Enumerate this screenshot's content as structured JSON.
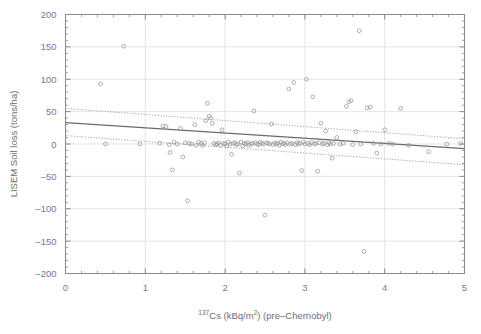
{
  "figure": {
    "background": "#ffffff",
    "axes_color": "#8a8a8a",
    "grid_color": "#d9d9d9",
    "marker_color": "#9a9a9a",
    "fit_color": "#6a6a6a",
    "ci_color": "#9a9a9a"
  },
  "labels": {
    "xaxis_prefix": "137",
    "xaxis_element": "Cs",
    "xaxis_units_open": " (kBq/m",
    "xaxis_units_exp": "2",
    "xaxis_units_close": ") (pre–Chernobyl)",
    "yaxis": "LISEM Soil loss (tons/ha)"
  },
  "chart_data": {
    "type": "scatter",
    "title": "",
    "xlabel": "137Cs (kBq/m2) (pre-Chernobyl)",
    "ylabel": "LISEM Soil loss (tons/ha)",
    "xlim": [
      0,
      5
    ],
    "ylim": [
      -200,
      200
    ],
    "xticks": [
      0,
      1,
      2,
      3,
      4,
      5
    ],
    "yticks": [
      -200,
      -150,
      -100,
      -50,
      0,
      50,
      100,
      150,
      200
    ],
    "xticklabels": [
      "0",
      "1",
      "2",
      "3",
      "4",
      "5"
    ],
    "yticklabels": [
      "-200",
      "-150",
      "-100",
      "-50",
      "0",
      "50",
      "100",
      "150",
      "200"
    ],
    "minor_ticks": true,
    "grid": true,
    "legend": null,
    "marker": "open-circle",
    "series": [
      {
        "name": "samples",
        "points": [
          [
            0.44,
            93
          ],
          [
            0.5,
            0
          ],
          [
            0.73,
            151
          ],
          [
            0.93,
            0
          ],
          [
            1.18,
            1
          ],
          [
            1.22,
            28
          ],
          [
            1.26,
            27
          ],
          [
            1.3,
            -1
          ],
          [
            1.31,
            -13
          ],
          [
            1.34,
            -40
          ],
          [
            1.36,
            3
          ],
          [
            1.4,
            0
          ],
          [
            1.44,
            24
          ],
          [
            1.47,
            -20
          ],
          [
            1.5,
            2
          ],
          [
            1.53,
            -88
          ],
          [
            1.55,
            1
          ],
          [
            1.58,
            0
          ],
          [
            1.62,
            30
          ],
          [
            1.64,
            -2
          ],
          [
            1.67,
            3
          ],
          [
            1.7,
            1
          ],
          [
            1.72,
            -2
          ],
          [
            1.74,
            2
          ],
          [
            1.76,
            36
          ],
          [
            1.78,
            63
          ],
          [
            1.8,
            43
          ],
          [
            1.82,
            40
          ],
          [
            1.84,
            32
          ],
          [
            1.86,
            1
          ],
          [
            1.88,
            -1
          ],
          [
            1.9,
            0
          ],
          [
            1.92,
            2
          ],
          [
            1.94,
            -2
          ],
          [
            1.96,
            22
          ],
          [
            1.98,
            1
          ],
          [
            2.0,
            0
          ],
          [
            2.02,
            -3
          ],
          [
            2.04,
            3
          ],
          [
            2.06,
            0
          ],
          [
            2.08,
            -16
          ],
          [
            2.1,
            1
          ],
          [
            2.12,
            2
          ],
          [
            2.14,
            -1
          ],
          [
            2.16,
            0
          ],
          [
            2.18,
            -45
          ],
          [
            2.2,
            3
          ],
          [
            2.22,
            -3
          ],
          [
            2.24,
            1
          ],
          [
            2.26,
            0
          ],
          [
            2.28,
            2
          ],
          [
            2.3,
            -2
          ],
          [
            2.32,
            0
          ],
          [
            2.34,
            1
          ],
          [
            2.36,
            51
          ],
          [
            2.38,
            2
          ],
          [
            2.4,
            0
          ],
          [
            2.42,
            -1
          ],
          [
            2.44,
            3
          ],
          [
            2.46,
            1
          ],
          [
            2.48,
            0
          ],
          [
            2.5,
            -110
          ],
          [
            2.52,
            2
          ],
          [
            2.54,
            1
          ],
          [
            2.56,
            0
          ],
          [
            2.58,
            31
          ],
          [
            2.6,
            -1
          ],
          [
            2.62,
            2
          ],
          [
            2.64,
            0
          ],
          [
            2.66,
            1
          ],
          [
            2.68,
            -2
          ],
          [
            2.7,
            3
          ],
          [
            2.72,
            0
          ],
          [
            2.74,
            1
          ],
          [
            2.76,
            -1
          ],
          [
            2.78,
            2
          ],
          [
            2.8,
            85
          ],
          [
            2.82,
            0
          ],
          [
            2.84,
            1
          ],
          [
            2.86,
            95
          ],
          [
            2.88,
            -1
          ],
          [
            2.9,
            2
          ],
          [
            2.92,
            0
          ],
          [
            2.94,
            1
          ],
          [
            2.96,
            -41
          ],
          [
            2.98,
            3
          ],
          [
            3.0,
            0
          ],
          [
            3.02,
            100
          ],
          [
            3.04,
            1
          ],
          [
            3.06,
            -1
          ],
          [
            3.08,
            2
          ],
          [
            3.1,
            73
          ],
          [
            3.12,
            0
          ],
          [
            3.14,
            1
          ],
          [
            3.16,
            -42
          ],
          [
            3.18,
            2
          ],
          [
            3.2,
            32
          ],
          [
            3.22,
            0
          ],
          [
            3.24,
            1
          ],
          [
            3.26,
            20
          ],
          [
            3.28,
            -1
          ],
          [
            3.3,
            2
          ],
          [
            3.32,
            0
          ],
          [
            3.34,
            -22
          ],
          [
            3.36,
            1
          ],
          [
            3.4,
            10
          ],
          [
            3.44,
            0
          ],
          [
            3.48,
            1
          ],
          [
            3.52,
            58
          ],
          [
            3.55,
            65
          ],
          [
            3.58,
            67
          ],
          [
            3.6,
            -1
          ],
          [
            3.64,
            19
          ],
          [
            3.68,
            175
          ],
          [
            3.7,
            0
          ],
          [
            3.74,
            -166
          ],
          [
            3.78,
            56
          ],
          [
            3.82,
            57
          ],
          [
            3.86,
            1
          ],
          [
            3.9,
            -14
          ],
          [
            3.95,
            0
          ],
          [
            4.0,
            22
          ],
          [
            4.05,
            1
          ],
          [
            4.1,
            0
          ],
          [
            4.2,
            55
          ],
          [
            4.3,
            -2
          ],
          [
            4.55,
            -12
          ],
          [
            4.78,
            0
          ],
          [
            4.95,
            1
          ]
        ]
      }
    ],
    "fit_line": {
      "style": "solid",
      "x": [
        0,
        5
      ],
      "y": [
        33,
        -7
      ],
      "slope": -8.0,
      "intercept": 33
    },
    "confidence_bands": [
      {
        "name": "upper",
        "style": "dotted",
        "x": [
          0,
          5
        ],
        "y": [
          55,
          8
        ]
      },
      {
        "name": "lower",
        "style": "dotted",
        "x": [
          0,
          5
        ],
        "y": [
          13,
          -32
        ]
      }
    ]
  }
}
